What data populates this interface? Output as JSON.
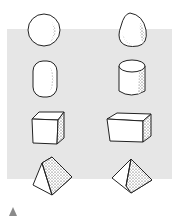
{
  "figure": {
    "background_panel_color": "#e6e6e6",
    "marker_color": "#8a8a8a",
    "shapes": [
      {
        "row": 1,
        "left": "sphere",
        "right": "egg-cone"
      },
      {
        "row": 2,
        "left": "rounded-cylinder",
        "right": "cylinder"
      },
      {
        "row": 3,
        "left": "cube",
        "right": "rectangular-box"
      },
      {
        "row": 4,
        "left": "pyramid",
        "right": "tilted-pyramid"
      }
    ],
    "marker": "triangle-up"
  }
}
